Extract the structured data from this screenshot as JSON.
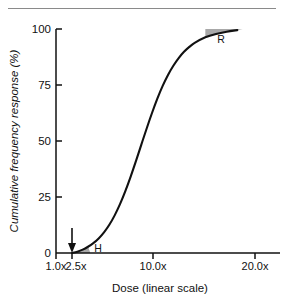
{
  "figure": {
    "background": "#ffffff",
    "has_top_rule": true,
    "line_color": "#111111",
    "shade_color": "#a8a8a8"
  },
  "chart_data": {
    "type": "line",
    "title": "",
    "xlabel": "Dose (linear scale)",
    "ylabel": "Cumulative frequency response (%)",
    "xlim": [
      1.0,
      22.0
    ],
    "ylim": [
      0,
      100
    ],
    "grid": false,
    "legend": "none",
    "x_tick_labels": [
      "1.0x",
      "2.5x",
      "10.0x",
      "20.0x"
    ],
    "x_tick_values": [
      1.0,
      2.5,
      10.0,
      20.0
    ],
    "y_tick_labels": [
      "0",
      "25",
      "50",
      "75",
      "100"
    ],
    "y_tick_values": [
      0,
      25,
      50,
      75,
      100
    ],
    "series": [
      {
        "name": "Cumulative frequency response",
        "x": [
          2.5,
          3.0,
          3.5,
          4.0,
          4.5,
          5.0,
          5.5,
          6.0,
          6.5,
          7.0,
          7.5,
          8.0,
          8.5,
          9.0,
          9.5,
          10.0,
          10.5,
          11.0,
          11.5,
          12.0,
          12.5,
          13.0,
          13.5,
          14.0,
          15.0,
          16.0,
          17.0,
          18.0
        ],
        "values": [
          0,
          0.6,
          1.5,
          2.8,
          4.4,
          6.5,
          9.2,
          12.6,
          16.8,
          21.8,
          27.6,
          34.1,
          41.1,
          48.4,
          55.6,
          62.5,
          68.9,
          74.6,
          79.5,
          83.6,
          87.0,
          89.8,
          92.0,
          93.8,
          96.3,
          97.8,
          98.8,
          99.5
        ]
      }
    ],
    "annotations": [
      {
        "name": "hyporesponder-region",
        "label": "H",
        "description": "shaded area under curve at low dose",
        "x_range": [
          2.5,
          4.2
        ],
        "y_range": [
          0,
          4
        ]
      },
      {
        "name": "resistant-region",
        "label": "R",
        "description": "shaded area above curve at high dose",
        "x_range": [
          14.5,
          18.5
        ],
        "y_range": [
          93,
          100
        ]
      },
      {
        "name": "threshold-arrow",
        "label": "",
        "description": "downward arrow marking threshold dose",
        "x_value": 2.5
      }
    ]
  }
}
